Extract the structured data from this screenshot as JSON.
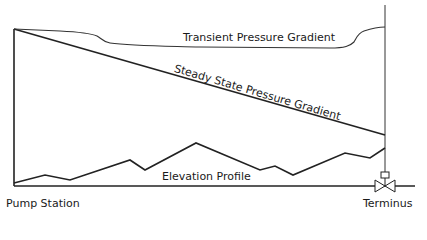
{
  "diagram": {
    "labels": {
      "transient": "Transient Pressure Gradient",
      "steady": "Steady State Pressure Gradient",
      "elevation": "Elevation Profile",
      "pump_station": "Pump Station",
      "terminus": "Terminus"
    },
    "colors": {
      "line": "#222222",
      "thin_line": "#444444",
      "background": "#ffffff"
    },
    "icons": {
      "valve": "gate-valve-icon"
    }
  }
}
